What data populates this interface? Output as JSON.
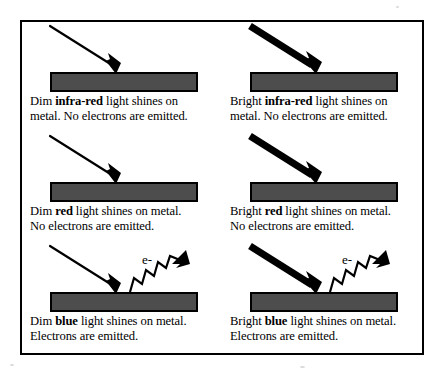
{
  "figure": {
    "border_color": "#000000",
    "background_color": "#ffffff",
    "metal_bar_fill": "#4d4d4d",
    "metal_bar_stroke": "#000000",
    "electron_label": "e-",
    "cells": [
      {
        "id": "dim-infra-red",
        "intensity": "Dim",
        "colour_word": "infra-red",
        "beam_style": "thin",
        "electron_emitted": false,
        "caption_line_1_before": "Dim ",
        "caption_line_1_bold": "infra-red",
        "caption_line_1_after": " light shines on",
        "caption_line_2": "metal. No electrons are emitted."
      },
      {
        "id": "bright-infra-red",
        "intensity": "Bright",
        "colour_word": "infra-red",
        "beam_style": "thick",
        "electron_emitted": false,
        "caption_line_1_before": "Bright ",
        "caption_line_1_bold": "infra-red",
        "caption_line_1_after": " light shines on",
        "caption_line_2": "metal. No electrons are emitted."
      },
      {
        "id": "dim-red",
        "intensity": "Dim",
        "colour_word": "red",
        "beam_style": "thin",
        "electron_emitted": false,
        "caption_line_1_before": "Dim ",
        "caption_line_1_bold": "red",
        "caption_line_1_after": " light shines on metal.",
        "caption_line_2": "No electrons are emitted."
      },
      {
        "id": "bright-red",
        "intensity": "Bright",
        "colour_word": "red",
        "beam_style": "thick",
        "electron_emitted": false,
        "caption_line_1_before": "Bright ",
        "caption_line_1_bold": "red",
        "caption_line_1_after": " light shines on metal.",
        "caption_line_2": "No electrons are emitted."
      },
      {
        "id": "dim-blue",
        "intensity": "Dim",
        "colour_word": "blue",
        "beam_style": "thin",
        "electron_emitted": true,
        "caption_line_1_before": "Dim ",
        "caption_line_1_bold": "blue",
        "caption_line_1_after": " light shines on metal.",
        "caption_line_2": "Electrons are emitted."
      },
      {
        "id": "bright-blue",
        "intensity": "Bright",
        "colour_word": "blue",
        "beam_style": "thick",
        "electron_emitted": true,
        "caption_line_1_before": "Bright ",
        "caption_line_1_bold": "blue",
        "caption_line_1_after": " light shines on metal.",
        "caption_line_2": "Electrons are emitted."
      }
    ]
  }
}
